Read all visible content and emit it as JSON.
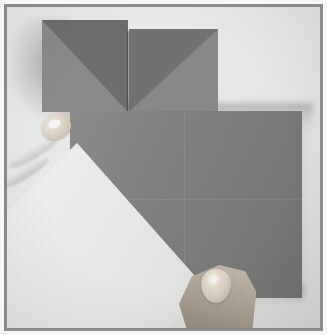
{
  "figure": {
    "kind": "photograph",
    "caption": "Two hands holding a square sheet of grey origami paper; the lower-left corner is lifted to reveal the white underside along a diagonal fold, with two folded triangular flaps standing up behind.",
    "orientation": "portrait",
    "color_mode": "grayscale"
  },
  "frame": {
    "border_color": "#8a8a8a",
    "border_width_px": 3,
    "inner_hairline_color": "#c9c9c7",
    "outer_margin_color": "#ffffff",
    "outer_margin_px": 4
  },
  "palette": {
    "background_surface": "#eeeeec",
    "paper_grey_top_left": "#8c8c8a",
    "paper_grey_top_right": "#8a8a88",
    "paper_grey_main": "#808080",
    "paper_shadow_triangle": "#5e5e5c",
    "paper_white_underside": "#eeeeec",
    "skin_light": "#cfc6bb",
    "skin_mid": "#b3a99d",
    "skin_dark": "#8b8278",
    "nail_light": "#efe9e0",
    "cast_shadow": "#5a5a5a"
  },
  "elements": {
    "flap_top_left": {
      "name": "top-left folded flap",
      "shape": "square",
      "shading": "upper-right triangle darker"
    },
    "flap_top_right": {
      "name": "top-right folded flap",
      "shape": "square",
      "shading": "upper-left triangle darker"
    },
    "main_square": {
      "name": "main grey square sheet",
      "shape": "square",
      "creases": [
        "vertical centre",
        "horizontal centre"
      ]
    },
    "lifted_triangle": {
      "name": "lifted white underside triangle",
      "shape": "triangle",
      "edge": "diagonal fold from upper-left to lower-right"
    },
    "hand_left": {
      "name": "left thumb gripping the lifted corner",
      "visible_parts": [
        "thumb",
        "thumbnail",
        "knuckle folds"
      ]
    },
    "hand_bottom": {
      "name": "bottom thumb steadying the lower edge",
      "visible_parts": [
        "thumb",
        "thumbnail"
      ]
    }
  }
}
